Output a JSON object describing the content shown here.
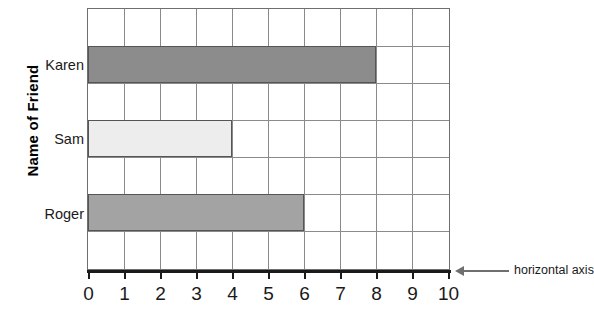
{
  "chart_data": {
    "type": "bar",
    "orientation": "horizontal",
    "title": "",
    "xlabel": "",
    "ylabel": "Name of Friend",
    "categories": [
      "Karen",
      "Sam",
      "Roger"
    ],
    "values": [
      8,
      4,
      6
    ],
    "xlim": [
      0,
      10
    ],
    "xticks": [
      "0",
      "1",
      "2",
      "3",
      "4",
      "5",
      "6",
      "7",
      "8",
      "9",
      "10"
    ],
    "grid": true,
    "legend": false,
    "bar_colors": [
      "#8c8c8c",
      "#ededed",
      "#a3a3a3"
    ],
    "bar_border_color": "#555555",
    "grid_color": "#8a8a8a",
    "axis_color": "#1a1a1a",
    "annotations": [
      {
        "text": "horizontal axis",
        "points_to": "x-axis",
        "arrow": "left"
      }
    ]
  },
  "axis_title": {
    "y": "Name of Friend"
  }
}
